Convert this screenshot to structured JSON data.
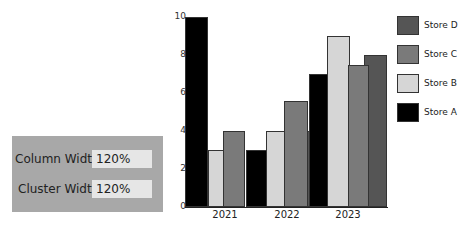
{
  "panel": {
    "column_width_label": "Column Width:",
    "column_width_value": "120%",
    "cluster_width_label": "Cluster Width:",
    "cluster_width_value": "120%"
  },
  "chart_data": {
    "type": "bar",
    "title": "",
    "xlabel": "",
    "ylabel": "",
    "categories": [
      "2021",
      "2022",
      "2023"
    ],
    "series": [
      {
        "name": "Store A",
        "color": "#000000",
        "values": [
          10,
          3,
          7
        ]
      },
      {
        "name": "Store B",
        "color": "#d6d6d6",
        "values": [
          3,
          4,
          9
        ]
      },
      {
        "name": "Store C",
        "color": "#7a7a7a",
        "values": [
          4,
          5.6,
          7.5
        ]
      },
      {
        "name": "Store D",
        "color": "#555555",
        "values": [
          0,
          4,
          8
        ]
      }
    ],
    "yticks": [
      "0",
      "2",
      "4",
      "6",
      "8",
      "10"
    ],
    "ylim": [
      0,
      10
    ],
    "grid": false,
    "legend_position": "right",
    "legend_order": [
      "Store D",
      "Store C",
      "Store B",
      "Store A"
    ],
    "column_width": "120%",
    "cluster_width": "120%"
  }
}
